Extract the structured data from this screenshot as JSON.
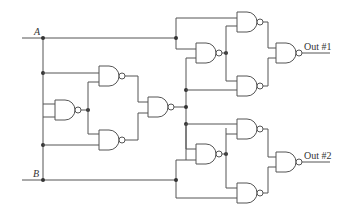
{
  "diagram": {
    "type": "logic-circuit",
    "gate_type": "NAND",
    "gate_count": 9,
    "inputs": [
      {
        "id": "A",
        "label": "A"
      },
      {
        "id": "B",
        "label": "B"
      }
    ],
    "outputs": [
      {
        "id": "out1",
        "label": "Out #1"
      },
      {
        "id": "out2",
        "label": "Out #2"
      }
    ],
    "colors": {
      "line": "#555555",
      "dot": "#333333",
      "background": "#ffffff"
    }
  }
}
